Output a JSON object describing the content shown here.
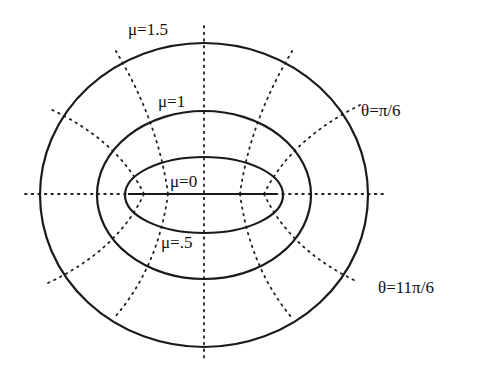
{
  "diagram": {
    "labels": {
      "mu_1_5": "μ=1.5",
      "mu_1": "μ=1",
      "mu_0": "μ=0",
      "mu_0_5": "μ=.5",
      "theta_pi_6": "θ=π/6",
      "theta_11pi_6": "θ=11π/6"
    },
    "ellipses": [
      {
        "name": "mu-1.5",
        "cx": 204,
        "cy": 195,
        "rx": 164,
        "ry": 152
      },
      {
        "name": "mu-1",
        "cx": 204,
        "cy": 195,
        "rx": 107,
        "ry": 84
      },
      {
        "name": "mu-0.5",
        "cx": 204,
        "cy": 195,
        "rx": 79,
        "ry": 38
      }
    ],
    "focal_segment": {
      "x1": 128,
      "x2": 276,
      "y": 194
    }
  }
}
